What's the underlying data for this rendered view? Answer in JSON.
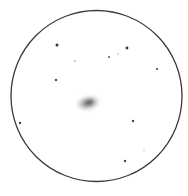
{
  "sketch": {
    "type": "eyepiece-drawing",
    "background": "#ffffff",
    "field_circle": {
      "cx": 96.5,
      "cy": 96,
      "r": 85.5,
      "stroke": "#3a3a3a",
      "stroke_width": 1.3
    },
    "galaxy": {
      "cx": 88,
      "cy": 103,
      "rx": 13,
      "ry": 8,
      "rotate": -12,
      "core_color": "#555555"
    },
    "stars": [
      {
        "x": 57,
        "y": 45,
        "r": 1.5,
        "color": "#333333"
      },
      {
        "x": 127,
        "y": 48,
        "r": 1.4,
        "color": "#333333"
      },
      {
        "x": 109,
        "y": 57,
        "r": 1.0,
        "color": "#555555"
      },
      {
        "x": 118,
        "y": 54,
        "r": 0.8,
        "color": "#b0b0b0"
      },
      {
        "x": 75,
        "y": 61,
        "r": 0.8,
        "color": "#888888"
      },
      {
        "x": 157,
        "y": 69,
        "r": 1.1,
        "color": "#444444"
      },
      {
        "x": 56,
        "y": 80,
        "r": 1.2,
        "color": "#444444"
      },
      {
        "x": 20,
        "y": 123,
        "r": 1.2,
        "color": "#444444"
      },
      {
        "x": 133,
        "y": 121,
        "r": 1.2,
        "color": "#444444"
      },
      {
        "x": 144,
        "y": 150,
        "r": 0.8,
        "color": "#c0c0c0"
      },
      {
        "x": 125,
        "y": 161,
        "r": 1.2,
        "color": "#444444"
      }
    ]
  }
}
